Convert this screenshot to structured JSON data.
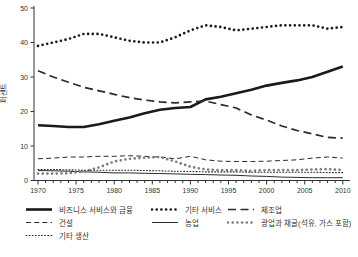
{
  "chart_data": {
    "type": "line",
    "title": "",
    "ylabel": "퍼센트",
    "ylim": [
      0,
      50
    ],
    "yticks": [
      0,
      10,
      20,
      30,
      40,
      50
    ],
    "xticks_labeled": [
      1970,
      1975,
      1980,
      1985,
      1990,
      1995,
      2000,
      2005,
      2010
    ],
    "xticks_minor_step": 1,
    "xlim": [
      1970,
      2010
    ],
    "grid": false,
    "legend_position": "below",
    "x": [
      1970,
      1972,
      1974,
      1976,
      1978,
      1980,
      1982,
      1984,
      1986,
      1988,
      1990,
      1992,
      1994,
      1996,
      1998,
      2000,
      2002,
      2004,
      2006,
      2008,
      2010
    ],
    "series": [
      {
        "name": "비즈니스 서비스와 금융",
        "style": "thick-solid",
        "color": "#1a1a1a",
        "values": [
          16,
          15.8,
          15.5,
          15.5,
          16.3,
          17.3,
          18.3,
          19.5,
          20.5,
          21,
          21.3,
          23.5,
          24.3,
          25.3,
          26.3,
          27.5,
          28.3,
          29,
          30,
          31.5,
          33
        ]
      },
      {
        "name": "기타 서비스",
        "style": "bold-dots",
        "color": "#1a1a1a",
        "values": [
          39,
          40,
          41,
          42.5,
          42.5,
          41.5,
          40.5,
          40,
          40,
          41.5,
          43.5,
          45,
          44.5,
          43.5,
          44,
          44.5,
          45,
          45,
          45,
          44,
          44.5
        ]
      },
      {
        "name": "제조업",
        "style": "bold-dash",
        "color": "#2a2a2a",
        "values": [
          31.8,
          30,
          28.5,
          27,
          26,
          25,
          24,
          23.3,
          22.8,
          22.5,
          22.8,
          23,
          22,
          21,
          19,
          17.5,
          15.8,
          14.5,
          13.5,
          12.5,
          12.3
        ]
      },
      {
        "name": "건설",
        "style": "thin-dash",
        "color": "#2a2a2a",
        "values": [
          6.3,
          6.5,
          6.8,
          6.8,
          7,
          7,
          7.2,
          7,
          6.8,
          6.3,
          7,
          6,
          5.6,
          5.5,
          5.5,
          5.6,
          5.8,
          6,
          6.5,
          6.8,
          6.5
        ]
      },
      {
        "name": "농업",
        "style": "thin-solid",
        "color": "#2a2a2a",
        "values": [
          2.9,
          2.8,
          2.7,
          2.5,
          2.4,
          2.2,
          2.2,
          2.1,
          2,
          1.9,
          1.8,
          1.7,
          1.6,
          1.5,
          1.3,
          1.2,
          1,
          0.9,
          0.8,
          0.8,
          0.8
        ]
      },
      {
        "name": "광업과 채굴(석유, 가스 포함)",
        "style": "bold-dots",
        "color": "#7d7d7d",
        "values": [
          2,
          2,
          2.1,
          2.6,
          3.8,
          5.5,
          6.3,
          6.6,
          6.8,
          5.5,
          4,
          3.2,
          3,
          3,
          2.8,
          3,
          3,
          3,
          3.2,
          3.3,
          3
        ]
      },
      {
        "name": "기타 생산",
        "style": "fine-dots",
        "color": "#2a2a2a",
        "values": [
          3.2,
          3.2,
          3.1,
          3,
          3,
          3,
          3,
          2.9,
          2.8,
          2.7,
          2.6,
          2.5,
          2.5,
          2.5,
          2.4,
          2.4,
          2.4,
          2.4,
          2.4,
          2.3,
          2.3
        ]
      }
    ],
    "axis_color": "#333333",
    "tick_label_color": "#333333"
  }
}
